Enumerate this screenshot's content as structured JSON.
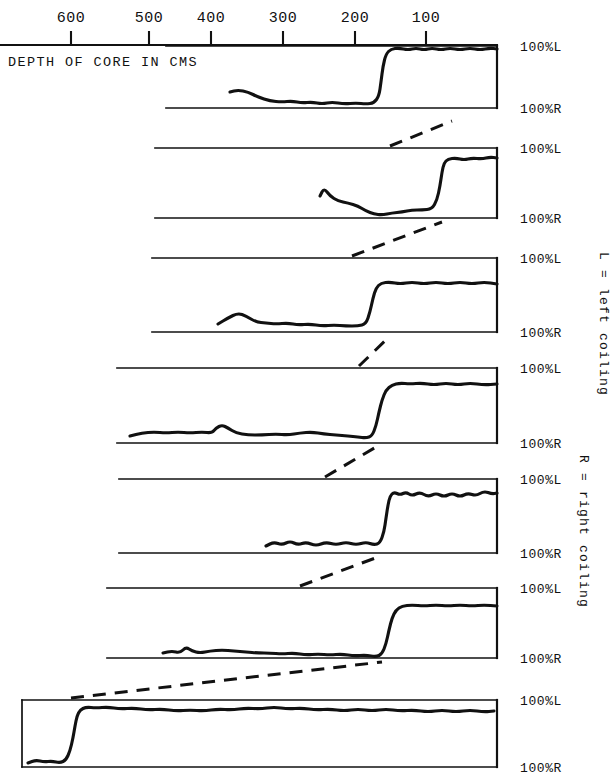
{
  "figure": {
    "axis_caption": "DEPTH OF CORE IN CMS",
    "axis_ticks": [
      {
        "label": "600",
        "value": 600,
        "x": 71
      },
      {
        "label": "500",
        "value": 500,
        "x": 149
      },
      {
        "label": "400",
        "value": 400,
        "x": 211
      },
      {
        "label": "300",
        "value": 300,
        "x": 283
      },
      {
        "label": "200",
        "value": 200,
        "x": 355
      },
      {
        "label": "100",
        "value": 100,
        "x": 426
      }
    ],
    "legend": [
      {
        "id": "legend-left-coiling",
        "text": "L = left coiling"
      },
      {
        "id": "legend-right-coiling",
        "text": "R = right coiling"
      }
    ],
    "label_top": "100%L",
    "label_bottom": "100%R",
    "ink_color": "#111111",
    "background_color": "#ffffff"
  },
  "chart_data": {
    "type": "line",
    "title": "",
    "subtitle": "",
    "xlabel": "DEPTH OF CORE IN CMS",
    "ylabel": "",
    "xlim": [
      700,
      0
    ],
    "ylim": [
      0,
      100
    ],
    "x_axis_reversed": true,
    "grid": false,
    "legend_position": "right-rotated",
    "y_tick_labels": [
      "100%L",
      "100%R"
    ],
    "x_tick_labels": [
      "600",
      "500",
      "400",
      "300",
      "200",
      "100"
    ],
    "x_ticks": [
      600,
      500,
      400,
      300,
      200,
      100
    ],
    "series": [
      {
        "name": "panel-1",
        "panel_index": 1,
        "top_label": "100%L",
        "bottom_label": "100%R",
        "panel_box": {
          "x0": 166,
          "x1": 497,
          "y_top": 46,
          "y_bottom": 108
        },
        "trace_start_depth_cm": 372,
        "reversal_depth_cm": 152,
        "points": [
          [
            230,
            92
          ],
          [
            238,
            90
          ],
          [
            248,
            92
          ],
          [
            258,
            97
          ],
          [
            270,
            101
          ],
          [
            282,
            102
          ],
          [
            292,
            101
          ],
          [
            302,
            103
          ],
          [
            312,
            102
          ],
          [
            322,
            104
          ],
          [
            332,
            102
          ],
          [
            344,
            104
          ],
          [
            356,
            103
          ],
          [
            366,
            104
          ],
          [
            374,
            103
          ],
          [
            379,
            96
          ],
          [
            381,
            82
          ],
          [
            383,
            66
          ],
          [
            386,
            54
          ],
          [
            391,
            49
          ],
          [
            399,
            48
          ],
          [
            408,
            50
          ],
          [
            416,
            48
          ],
          [
            424,
            50
          ],
          [
            432,
            48
          ],
          [
            441,
            50
          ],
          [
            450,
            48
          ],
          [
            460,
            50
          ],
          [
            470,
            48
          ],
          [
            480,
            50
          ],
          [
            490,
            48
          ],
          [
            497,
            49
          ]
        ]
      },
      {
        "name": "panel-2",
        "panel_index": 2,
        "top_label": "100%L",
        "bottom_label": "100%R",
        "panel_box": {
          "x0": 155,
          "x1": 497,
          "y_top": 148,
          "y_bottom": 218
        },
        "trace_start_depth_cm": 250,
        "reversal_depth_cm": 85,
        "points": [
          [
            320,
            196
          ],
          [
            324,
            188
          ],
          [
            330,
            196
          ],
          [
            338,
            201
          ],
          [
            348,
            203
          ],
          [
            358,
            206
          ],
          [
            366,
            211
          ],
          [
            374,
            214
          ],
          [
            382,
            215
          ],
          [
            392,
            213
          ],
          [
            402,
            212
          ],
          [
            412,
            210
          ],
          [
            422,
            210
          ],
          [
            432,
            209
          ],
          [
            437,
            200
          ],
          [
            440,
            186
          ],
          [
            442,
            172
          ],
          [
            444,
            163
          ],
          [
            448,
            159
          ],
          [
            456,
            158
          ],
          [
            464,
            160
          ],
          [
            472,
            158
          ],
          [
            482,
            159
          ],
          [
            490,
            157
          ],
          [
            497,
            158
          ]
        ]
      },
      {
        "name": "panel-3",
        "panel_index": 3,
        "top_label": "100%L",
        "bottom_label": "100%R",
        "panel_box": {
          "x0": 152,
          "x1": 497,
          "y_top": 258,
          "y_bottom": 332
        },
        "trace_start_depth_cm": 330,
        "reversal_depth_cm": 185,
        "points": [
          [
            218,
            324
          ],
          [
            228,
            318
          ],
          [
            238,
            313
          ],
          [
            246,
            316
          ],
          [
            256,
            322
          ],
          [
            266,
            323
          ],
          [
            276,
            324
          ],
          [
            288,
            323
          ],
          [
            298,
            325
          ],
          [
            310,
            324
          ],
          [
            322,
            326
          ],
          [
            334,
            325
          ],
          [
            346,
            326
          ],
          [
            358,
            326
          ],
          [
            366,
            324
          ],
          [
            370,
            312
          ],
          [
            373,
            298
          ],
          [
            376,
            288
          ],
          [
            381,
            283
          ],
          [
            390,
            282
          ],
          [
            400,
            284
          ],
          [
            412,
            282
          ],
          [
            424,
            284
          ],
          [
            436,
            282
          ],
          [
            448,
            284
          ],
          [
            460,
            282
          ],
          [
            472,
            284
          ],
          [
            484,
            282
          ],
          [
            497,
            284
          ]
        ]
      },
      {
        "name": "panel-4",
        "panel_index": 4,
        "top_label": "100%L",
        "bottom_label": "100%R",
        "panel_box": {
          "x0": 117,
          "x1": 497,
          "y_top": 368,
          "y_bottom": 443
        },
        "trace_start_depth_cm": 560,
        "reversal_depth_cm": 170,
        "points": [
          [
            130,
            436
          ],
          [
            142,
            433
          ],
          [
            154,
            432
          ],
          [
            166,
            433
          ],
          [
            178,
            432
          ],
          [
            190,
            433
          ],
          [
            202,
            432
          ],
          [
            212,
            433
          ],
          [
            216,
            428
          ],
          [
            222,
            425
          ],
          [
            228,
            428
          ],
          [
            236,
            433
          ],
          [
            248,
            435
          ],
          [
            262,
            435
          ],
          [
            276,
            434
          ],
          [
            288,
            435
          ],
          [
            300,
            433
          ],
          [
            312,
            432
          ],
          [
            324,
            434
          ],
          [
            336,
            435
          ],
          [
            348,
            436
          ],
          [
            358,
            437
          ],
          [
            366,
            438
          ],
          [
            372,
            436
          ],
          [
            376,
            426
          ],
          [
            379,
            412
          ],
          [
            382,
            400
          ],
          [
            386,
            390
          ],
          [
            392,
            385
          ],
          [
            400,
            383
          ],
          [
            410,
            384
          ],
          [
            422,
            383
          ],
          [
            434,
            385
          ],
          [
            446,
            383
          ],
          [
            458,
            385
          ],
          [
            470,
            383
          ],
          [
            484,
            385
          ],
          [
            497,
            384
          ]
        ]
      },
      {
        "name": "panel-5",
        "panel_index": 5,
        "top_label": "100%L",
        "bottom_label": "100%R",
        "panel_box": {
          "x0": 119,
          "x1": 497,
          "y_top": 479,
          "y_bottom": 553
        },
        "trace_start_depth_cm": 305,
        "reversal_depth_cm": 140,
        "points": [
          [
            266,
            546
          ],
          [
            274,
            542
          ],
          [
            282,
            545
          ],
          [
            290,
            541
          ],
          [
            298,
            545
          ],
          [
            306,
            542
          ],
          [
            316,
            546
          ],
          [
            326,
            542
          ],
          [
            336,
            545
          ],
          [
            346,
            542
          ],
          [
            356,
            545
          ],
          [
            366,
            542
          ],
          [
            374,
            545
          ],
          [
            380,
            543
          ],
          [
            384,
            532
          ],
          [
            386,
            518
          ],
          [
            388,
            505
          ],
          [
            390,
            496
          ],
          [
            394,
            492
          ],
          [
            400,
            495
          ],
          [
            406,
            492
          ],
          [
            412,
            496
          ],
          [
            420,
            492
          ],
          [
            428,
            497
          ],
          [
            436,
            493
          ],
          [
            444,
            497
          ],
          [
            452,
            493
          ],
          [
            460,
            497
          ],
          [
            468,
            493
          ],
          [
            476,
            496
          ],
          [
            484,
            491
          ],
          [
            492,
            494
          ],
          [
            497,
            493
          ]
        ]
      },
      {
        "name": "panel-6",
        "panel_index": 6,
        "top_label": "100%L",
        "bottom_label": "100%R",
        "panel_box": {
          "x0": 107,
          "x1": 497,
          "y_top": 588,
          "y_bottom": 658
        },
        "trace_start_depth_cm": 470,
        "reversal_depth_cm": 140,
        "points": [
          [
            163,
            653
          ],
          [
            172,
            651
          ],
          [
            180,
            653
          ],
          [
            186,
            647
          ],
          [
            192,
            651
          ],
          [
            200,
            653
          ],
          [
            210,
            651
          ],
          [
            222,
            650
          ],
          [
            234,
            651
          ],
          [
            246,
            652
          ],
          [
            258,
            653
          ],
          [
            270,
            653
          ],
          [
            282,
            654
          ],
          [
            294,
            653
          ],
          [
            306,
            655
          ],
          [
            318,
            654
          ],
          [
            330,
            655
          ],
          [
            342,
            654
          ],
          [
            354,
            656
          ],
          [
            366,
            655
          ],
          [
            376,
            657
          ],
          [
            382,
            654
          ],
          [
            386,
            644
          ],
          [
            389,
            630
          ],
          [
            392,
            618
          ],
          [
            396,
            610
          ],
          [
            402,
            606
          ],
          [
            412,
            605
          ],
          [
            424,
            606
          ],
          [
            436,
            605
          ],
          [
            448,
            606
          ],
          [
            460,
            605
          ],
          [
            472,
            606
          ],
          [
            484,
            605
          ],
          [
            497,
            606
          ]
        ]
      },
      {
        "name": "panel-7",
        "panel_index": 7,
        "top_label": "100%L",
        "bottom_label": "100%R",
        "panel_box": {
          "x0": 22,
          "x1": 497,
          "y_top": 700,
          "y_bottom": 767
        },
        "trace_start_depth_cm": 680,
        "reversal_depth_cm": 610,
        "points": [
          [
            28,
            763
          ],
          [
            36,
            760
          ],
          [
            44,
            762
          ],
          [
            52,
            761
          ],
          [
            60,
            763
          ],
          [
            66,
            760
          ],
          [
            70,
            751
          ],
          [
            73,
            738
          ],
          [
            75,
            726
          ],
          [
            77,
            716
          ],
          [
            80,
            710
          ],
          [
            86,
            707
          ],
          [
            96,
            708
          ],
          [
            108,
            707
          ],
          [
            120,
            709
          ],
          [
            134,
            708
          ],
          [
            148,
            710
          ],
          [
            162,
            709
          ],
          [
            176,
            711
          ],
          [
            190,
            710
          ],
          [
            204,
            711
          ],
          [
            218,
            709
          ],
          [
            232,
            710
          ],
          [
            246,
            708
          ],
          [
            260,
            709
          ],
          [
            274,
            707
          ],
          [
            288,
            709
          ],
          [
            302,
            708
          ],
          [
            316,
            710
          ],
          [
            330,
            709
          ],
          [
            344,
            711
          ],
          [
            358,
            709
          ],
          [
            372,
            711
          ],
          [
            386,
            709
          ],
          [
            400,
            711
          ],
          [
            414,
            710
          ],
          [
            428,
            712
          ],
          [
            442,
            710
          ],
          [
            456,
            712
          ],
          [
            470,
            710
          ],
          [
            484,
            712
          ],
          [
            494,
            711
          ]
        ]
      }
    ],
    "connectors": [
      {
        "name": "connector-1-2",
        "from": [
          390,
          146
        ],
        "to": [
          452,
          121
        ]
      },
      {
        "name": "connector-2-3",
        "from": [
          352,
          256
        ],
        "to": [
          442,
          222
        ]
      },
      {
        "name": "connector-3-4",
        "from": [
          359,
          366
        ],
        "to": [
          389,
          337
        ]
      },
      {
        "name": "connector-4-5",
        "from": [
          325,
          477
        ],
        "to": [
          376,
          447
        ]
      },
      {
        "name": "connector-5-6",
        "from": [
          300,
          586
        ],
        "to": [
          378,
          557
        ]
      },
      {
        "name": "connector-6-7",
        "from": [
          71,
          698
        ],
        "to": [
          382,
          662
        ]
      }
    ]
  }
}
